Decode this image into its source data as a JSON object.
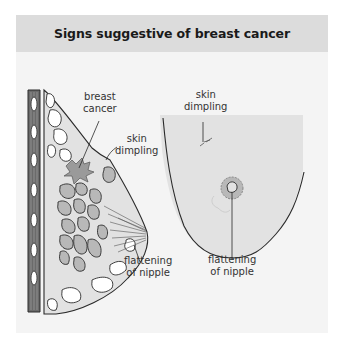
{
  "header": {
    "title": "Signs suggestive of breast cancer"
  },
  "left_figure": {
    "name": "side-view cross-section",
    "labels": {
      "breast_cancer_1": "breast",
      "breast_cancer_2": "cancer",
      "skin_dimpling_1": "skin",
      "skin_dimpling_2": "dimpling",
      "flattening_1": "flattening",
      "flattening_2": "of nipple"
    }
  },
  "right_figure": {
    "name": "front view",
    "labels": {
      "skin_dimpling_1": "skin",
      "skin_dimpling_2": "dimpling",
      "flattening_1": "flattening",
      "flattening_2": "of nipple"
    }
  },
  "colors": {
    "panel_bg": "#f4f4f4",
    "header_bg": "#dcdcdc",
    "tissue": "#e2e2e2",
    "lobule": "#b8b8b8",
    "muscle": "#6a6a6a",
    "line": "#2a2a2a"
  }
}
